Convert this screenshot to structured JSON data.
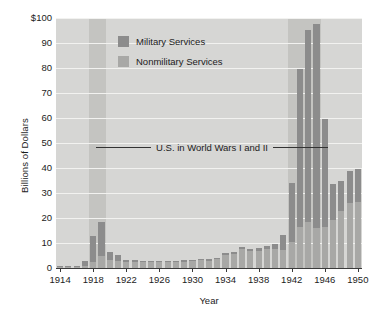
{
  "chart_data": {
    "type": "bar",
    "stacked": true,
    "title": "",
    "xlabel": "Year",
    "ylabel": "Billions of Dollars",
    "ylim": [
      0,
      100
    ],
    "ytick_labels": [
      "$100",
      "90",
      "80",
      "70",
      "60",
      "50",
      "40",
      "30",
      "20",
      "10",
      "0"
    ],
    "ytick_values": [
      100,
      90,
      80,
      70,
      60,
      50,
      40,
      30,
      20,
      10,
      0
    ],
    "xtick_labels": [
      "1914",
      "1918",
      "1922",
      "1926",
      "1930",
      "1934",
      "1938",
      "1942",
      "1946",
      "1950"
    ],
    "xtick_values": [
      1914,
      1918,
      1922,
      1926,
      1930,
      1934,
      1938,
      1942,
      1946,
      1950
    ],
    "xlim": [
      1913.5,
      1950.5
    ],
    "grid": "horizontal",
    "legend_position": "upper-left-inside",
    "categories": [
      1914,
      1915,
      1916,
      1917,
      1918,
      1919,
      1920,
      1921,
      1922,
      1923,
      1924,
      1925,
      1926,
      1927,
      1928,
      1929,
      1930,
      1931,
      1932,
      1933,
      1934,
      1935,
      1936,
      1937,
      1938,
      1939,
      1940,
      1941,
      1942,
      1943,
      1944,
      1945,
      1946,
      1947,
      1948,
      1949,
      1950
    ],
    "series": [
      {
        "name": "Military Services",
        "color": "#8c8c8c",
        "values": [
          0.2,
          0.3,
          0.3,
          2.0,
          10.6,
          13.5,
          3.2,
          2.1,
          0.9,
          0.7,
          0.6,
          0.6,
          0.6,
          0.6,
          0.7,
          0.7,
          0.7,
          0.7,
          0.7,
          0.6,
          0.7,
          0.7,
          0.9,
          0.9,
          1.0,
          1.2,
          1.7,
          6.3,
          23.9,
          63.2,
          76.9,
          81.6,
          43.2,
          14.4,
          11.8,
          13.0,
          13.0
        ]
      },
      {
        "name": "Nonmilitary Services",
        "color": "#a8a8a6",
        "values": [
          0.5,
          0.5,
          0.4,
          0.8,
          2.4,
          5.0,
          3.1,
          3.0,
          2.4,
          2.4,
          2.3,
          2.3,
          2.4,
          2.3,
          2.3,
          2.4,
          2.7,
          3.1,
          3.0,
          3.5,
          5.2,
          5.8,
          7.7,
          6.8,
          6.9,
          7.8,
          7.8,
          7.1,
          10.3,
          16.3,
          18.4,
          16.2,
          16.3,
          19.1,
          22.9,
          26.0,
          26.5
        ]
      }
    ],
    "totals": [
      0.7,
      0.8,
      0.7,
      2.8,
      13.0,
      18.5,
      6.3,
      5.1,
      3.3,
      3.1,
      2.9,
      2.9,
      3.0,
      2.9,
      3.0,
      3.1,
      3.4,
      3.8,
      3.7,
      4.1,
      5.9,
      6.5,
      8.6,
      7.7,
      7.9,
      9.0,
      9.5,
      13.4,
      34.2,
      79.5,
      95.3,
      97.8,
      59.5,
      33.5,
      34.7,
      39.0,
      39.5
    ],
    "annotations": [
      {
        "label": "U.S. in World Wars I and II",
        "type": "span-label",
        "leader_lines": 2
      }
    ],
    "shaded_bands": [
      {
        "name": "world-war-i-band",
        "start": 1917.5,
        "end": 1919.5,
        "color": "#c4c4c1"
      },
      {
        "name": "world-war-ii-band",
        "start": 1941.5,
        "end": 1945.5,
        "color": "#c4c4c1"
      }
    ],
    "plot_background": "#d6d6d4",
    "gridline_color": "#f2f2f0"
  },
  "legend": {
    "items": [
      {
        "label": "Military Services",
        "color": "#8c8c8c"
      },
      {
        "label": "Nonmilitary Services",
        "color": "#a8a8a6"
      }
    ]
  }
}
